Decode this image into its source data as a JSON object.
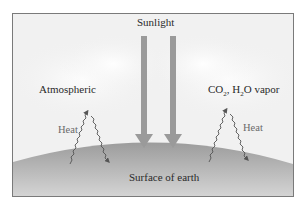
{
  "diagram": {
    "title_label": "Sunlight",
    "left_label": "Atmospheric",
    "right_label_parts": {
      "co": "CO",
      "co_sub": "2",
      "sep": ", H",
      "h_sub": "2",
      "rest": "O vapor"
    },
    "heat_left": "Heat",
    "heat_right": "Heat",
    "surface_label": "Surface of earth",
    "colors": {
      "frame_bg": "#f1f1f1",
      "arrow": "#9a9a9a",
      "earth": "#a8a8a8",
      "border": "#7a7a7a",
      "squiggle": "#555555"
    }
  }
}
